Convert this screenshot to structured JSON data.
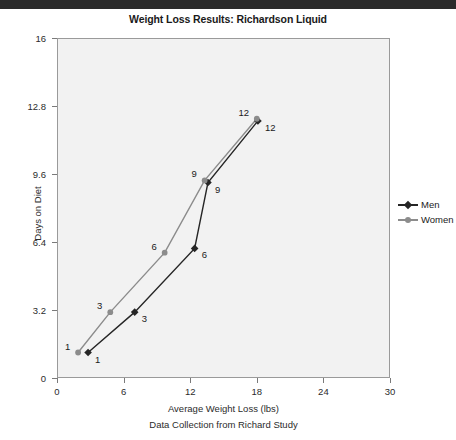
{
  "window": {
    "top_bar_color": "#2b2b2b"
  },
  "chart_data": {
    "type": "line",
    "title": "Weight Loss Results: Richardson Liquid",
    "xlabel": "Average Weight Loss (lbs)",
    "sublabel": "Data Collection from Richard Study",
    "ylabel": "Days on Diet",
    "xlim": [
      0,
      30
    ],
    "ylim": [
      0,
      16
    ],
    "xticks": [
      "0",
      "6",
      "12",
      "18",
      "24",
      "30"
    ],
    "xtick_values": [
      0,
      6,
      12,
      18,
      24,
      30
    ],
    "yticks": [
      "0",
      "3.2",
      "6.4",
      "9.6",
      "12.8",
      "16"
    ],
    "ytick_values": [
      0,
      3.2,
      6.4,
      9.6,
      12.8,
      16
    ],
    "grid": false,
    "legend_position": "right",
    "plot_background": "#f2f2f2",
    "series": [
      {
        "name": "Men",
        "color": "#262626",
        "marker": "diamond",
        "points": [
          {
            "x": 2.8,
            "y": 1.2,
            "label": "1",
            "label_pos": "right"
          },
          {
            "x": 7.0,
            "y": 3.1,
            "label": "3",
            "label_pos": "right"
          },
          {
            "x": 12.4,
            "y": 6.1,
            "label": "6",
            "label_pos": "right"
          },
          {
            "x": 13.6,
            "y": 9.2,
            "label": "9",
            "label_pos": "right"
          },
          {
            "x": 18.1,
            "y": 12.1,
            "label": "12",
            "label_pos": "right"
          }
        ]
      },
      {
        "name": "Women",
        "color": "#8c8c8c",
        "marker": "circle",
        "points": [
          {
            "x": 1.9,
            "y": 1.2,
            "label": "1",
            "label_pos": "left"
          },
          {
            "x": 4.8,
            "y": 3.1,
            "label": "3",
            "label_pos": "left"
          },
          {
            "x": 9.7,
            "y": 5.9,
            "label": "6",
            "label_pos": "left"
          },
          {
            "x": 13.3,
            "y": 9.3,
            "label": "9",
            "label_pos": "left"
          },
          {
            "x": 18.0,
            "y": 12.2,
            "label": "12",
            "label_pos": "left"
          }
        ]
      }
    ]
  }
}
